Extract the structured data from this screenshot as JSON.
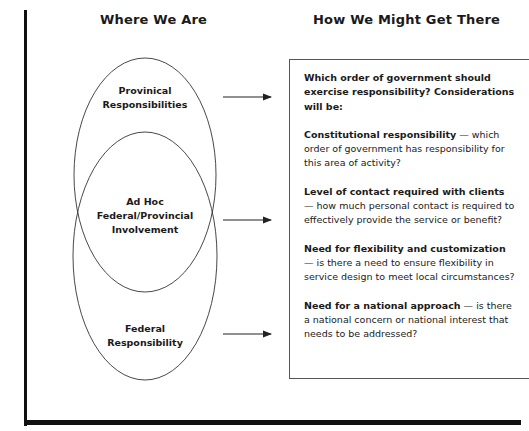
{
  "headings": {
    "left": "Where We Are",
    "right": "How We Might Get There"
  },
  "ellipses": {
    "provincial": [
      "Provinical",
      "Responsibilities"
    ],
    "adhoc": [
      "Ad Hoc",
      "Federal/Provincial",
      "Involvement"
    ],
    "federal": [
      "Federal",
      "Responsibility"
    ]
  },
  "box": {
    "intro": "Which order of government should exercise responsibility? Considerations will be:",
    "considerations": [
      {
        "title": "Constitutional responsibility",
        "text": " — which order of government has responsibility for this area of activity?"
      },
      {
        "title": "Level of contact required with clients",
        "text": " — how much personal contact is required to effectively provide the service or benefit?"
      },
      {
        "title": "Need for flexibility and customization",
        "text": " — is there a need to ensure flexibility in service design to meet local circumstances?"
      },
      {
        "title": "Need for a national approach",
        "text": " — is there a national concern or national interest that needs to be addressed?"
      }
    ]
  },
  "colors": {
    "line": "#333333",
    "frame": "#111111",
    "text": "#1a1a1a"
  }
}
